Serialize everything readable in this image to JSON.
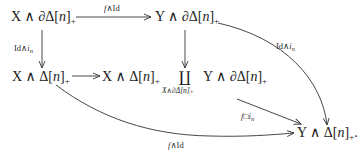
{
  "diagram": {
    "type": "commutative-diagram",
    "nodes": {
      "top_left": {
        "pre": "X ∧ ∂Δ[",
        "var": "n",
        "post": "]",
        "sub": "+"
      },
      "top_right": {
        "pre": "Y ∧ ∂Δ[",
        "var": "n",
        "post": "]",
        "sub": "+"
      },
      "mid_left": {
        "pre": "X ∧ Δ[",
        "var": "n",
        "post": "]",
        "sub": "+"
      },
      "mid_pushout_left": {
        "pre": "X ∧ Δ[",
        "var": "n",
        "post": "]",
        "sub": "+"
      },
      "coproduct_symbol": "∐",
      "coproduct_subscript": "X∧∂Δ[n]₊",
      "mid_pushout_right": {
        "pre": "Y ∧ ∂Δ[",
        "var": "n",
        "post": "]",
        "sub": "+"
      },
      "bottom_right": {
        "pre": "Y ∧ Δ[",
        "var": "n",
        "post": "]",
        "sub": "+",
        "trail": "."
      }
    },
    "arrows": {
      "top": {
        "label_f": "f",
        "label_rest": "∧Id"
      },
      "left_vertical": {
        "label_pre": "Id∧",
        "label_i": "i",
        "label_sub": "n"
      },
      "mid_horizontal": {},
      "mid_vertical": {},
      "right_curve": {
        "label_pre": "Id∧",
        "label_i": "i",
        "label_sub": "n"
      },
      "pushout_map": {
        "label_f": "f",
        "label_mid": "□",
        "label_i": "i",
        "label_sub": "n"
      },
      "bottom_curve": {
        "label_f": "f",
        "label_rest": "∧Id"
      }
    },
    "colors": {
      "ink": "#1a1a1a",
      "arrow": "#333333",
      "background": "#ffffff"
    }
  }
}
